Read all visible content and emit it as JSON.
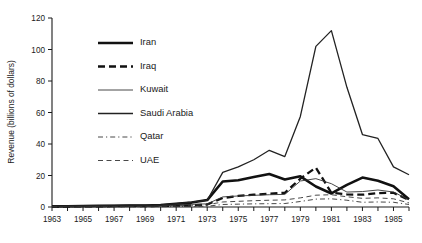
{
  "chart_data": {
    "type": "line",
    "title": "",
    "xlabel": "",
    "ylabel": "Revenue (billions of dollars)",
    "xlim": [
      1963,
      1986
    ],
    "ylim": [
      0,
      120
    ],
    "ytick_values": [
      0,
      20,
      40,
      60,
      80,
      100,
      120
    ],
    "ytick_labels": [
      "0",
      "20",
      "40",
      "60",
      "80",
      "100",
      "120"
    ],
    "xtick_values": [
      1963,
      1964,
      1965,
      1966,
      1967,
      1968,
      1969,
      1970,
      1971,
      1972,
      1973,
      1974,
      1975,
      1976,
      1977,
      1978,
      1979,
      1980,
      1981,
      1982,
      1983,
      1984,
      1985,
      1986
    ],
    "xtick_labels_shown": [
      "1963",
      "1965",
      "1967",
      "1969",
      "1971",
      "1973",
      "1975",
      "1977",
      "1979",
      "1981",
      "1983",
      "1985"
    ],
    "grid": false,
    "legend_position": "upper-left-inside",
    "x": [
      1963,
      1964,
      1965,
      1966,
      1967,
      1968,
      1969,
      1970,
      1971,
      1972,
      1973,
      1974,
      1975,
      1976,
      1977,
      1978,
      1979,
      1980,
      1981,
      1982,
      1983,
      1984,
      1985,
      1986
    ],
    "series": [
      {
        "name": "Iran",
        "style": "solid",
        "width": 2.6,
        "color": "#111111",
        "values": [
          0.4,
          0.5,
          0.6,
          0.7,
          0.8,
          0.9,
          1.0,
          1.2,
          2.0,
          2.8,
          4.4,
          16.2,
          17.0,
          19.0,
          21.0,
          17.5,
          19.5,
          13.0,
          8.6,
          14.0,
          18.7,
          16.6,
          13.2,
          5.0
        ]
      },
      {
        "name": "Iraq",
        "style": "dashed",
        "width": 2.3,
        "color": "#111111",
        "values": [
          0.3,
          0.3,
          0.4,
          0.4,
          0.5,
          0.6,
          0.6,
          0.7,
          0.9,
          1.0,
          1.6,
          5.7,
          7.0,
          7.8,
          8.5,
          9.0,
          18.0,
          25.0,
          9.0,
          8.0,
          7.8,
          8.8,
          9.0,
          4.4
        ]
      },
      {
        "name": "Kuwait",
        "style": "solid",
        "width": 0.9,
        "color": "#333333",
        "values": [
          0.3,
          0.4,
          0.4,
          0.5,
          0.6,
          0.7,
          0.7,
          0.8,
          1.4,
          1.7,
          2.0,
          6.4,
          7.0,
          7.4,
          7.8,
          8.0,
          16.5,
          18.0,
          14.8,
          9.5,
          9.8,
          10.8,
          9.5,
          4.6
        ]
      },
      {
        "name": "Saudi Arabia",
        "style": "solid",
        "width": 1.3,
        "color": "#222222",
        "values": [
          0.6,
          0.7,
          0.8,
          0.9,
          1.0,
          1.1,
          1.2,
          1.3,
          2.2,
          3.1,
          4.3,
          22.0,
          25.5,
          30.0,
          36.0,
          32.0,
          57.5,
          102.0,
          112.0,
          76.0,
          46.0,
          43.5,
          25.5,
          20.5
        ]
      },
      {
        "name": "Qatar",
        "style": "dashdot",
        "width": 0.9,
        "color": "#333333",
        "values": [
          0.1,
          0.1,
          0.1,
          0.1,
          0.1,
          0.2,
          0.2,
          0.2,
          0.3,
          0.4,
          0.5,
          1.6,
          1.8,
          2.0,
          2.1,
          2.2,
          3.5,
          5.0,
          5.2,
          4.3,
          3.0,
          3.2,
          3.0,
          1.6
        ]
      },
      {
        "name": "UAE",
        "style": "dashed",
        "width": 0.9,
        "color": "#333333",
        "values": [
          0.1,
          0.1,
          0.1,
          0.2,
          0.2,
          0.3,
          0.4,
          0.5,
          0.8,
          1.1,
          1.4,
          3.2,
          3.6,
          4.0,
          4.3,
          4.5,
          5.8,
          7.5,
          7.8,
          6.5,
          5.5,
          5.8,
          5.2,
          2.6
        ]
      }
    ]
  },
  "legend": {
    "items": [
      {
        "label": "Iran"
      },
      {
        "label": "Iraq"
      },
      {
        "label": "Kuwait"
      },
      {
        "label": "Saudi Arabia"
      },
      {
        "label": "Qatar"
      },
      {
        "label": "UAE"
      }
    ]
  }
}
